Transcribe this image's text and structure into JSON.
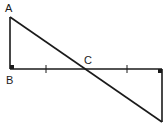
{
  "diagram": {
    "type": "geometry",
    "points": {
      "A": {
        "label": "A",
        "x": 10,
        "y": 17
      },
      "B": {
        "label": "B",
        "x": 10,
        "y": 69
      },
      "C": {
        "label": "C",
        "x": 86,
        "y": 69
      },
      "D": {
        "label": "",
        "x": 162,
        "y": 69
      },
      "E": {
        "label": "",
        "x": 162,
        "y": 122
      }
    },
    "labels": {
      "A": "A",
      "B": "B",
      "C": "C"
    },
    "segments": [
      {
        "from": "A",
        "to": "B"
      },
      {
        "from": "B",
        "to": "D"
      },
      {
        "from": "D",
        "to": "E"
      },
      {
        "from": "A",
        "to": "E"
      }
    ],
    "tick_marks": [
      {
        "segment": "BC",
        "x": 46,
        "y": 69
      },
      {
        "segment": "CD",
        "x": 127,
        "y": 69
      }
    ],
    "right_angles": [
      "B",
      "D"
    ],
    "stroke_color": "#1a1a1a"
  }
}
